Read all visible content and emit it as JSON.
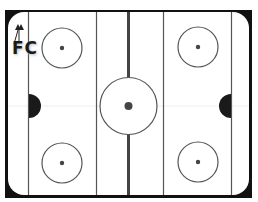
{
  "diagram": {
    "type": "ice-hockey-rink",
    "logo": {
      "text": "FC",
      "icon": "double-arrow-up-icon"
    },
    "colors": {
      "frame": "#111111",
      "ice": "#ffffff",
      "lines": "#555555",
      "center_line": "#444444",
      "crease": "#1a1a1a",
      "dots": "#444444"
    },
    "elements": {
      "goal_lines": 2,
      "blue_lines": 2,
      "center_line": 1,
      "center_circle": 1,
      "faceoff_circles": 4,
      "goal_creases": 2
    }
  }
}
